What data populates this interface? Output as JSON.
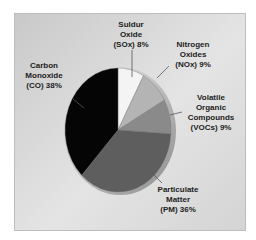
{
  "chart_data": {
    "type": "pie",
    "title": "",
    "categories": [
      "Carbon Monoxide (CO)",
      "Sulfur Oxide (SOx)",
      "Nitrogen Oxides (NOx)",
      "Volatile Organic Compounds (VOCs)",
      "Particulate Matter (PM)"
    ],
    "values": [
      38,
      8,
      9,
      9,
      36
    ],
    "unit": "%",
    "colors": [
      "#050505",
      "#f4f4f4",
      "#b4b4b4",
      "#8a8a8a",
      "#5e5e5e"
    ],
    "legend": "none (callout labels)"
  },
  "labels": {
    "co": [
      "Carbon",
      "Monoxide",
      "(CO) 38%"
    ],
    "sox": [
      "Suldur",
      "Oxide",
      "(SOx) 8%"
    ],
    "nox": [
      "Nitrogen",
      "Oxides",
      "(NOx) 9%"
    ],
    "voc": [
      "Volatile",
      "Organic",
      "Compounds",
      "(VOCs) 9%"
    ],
    "pm": [
      "Particulate",
      "Matter",
      "(PM) 36%"
    ]
  }
}
